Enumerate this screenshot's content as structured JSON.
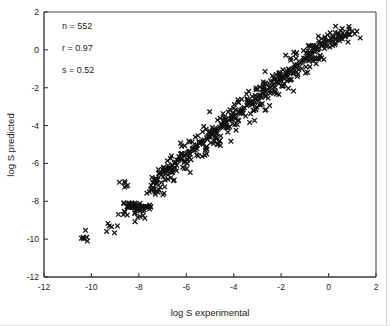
{
  "chart_data": {
    "type": "scatter",
    "title": "",
    "xlabel": "log S experimental",
    "ylabel": "log S predicted",
    "xlim": [
      -12,
      2
    ],
    "ylim": [
      -12,
      2
    ],
    "xticks": [
      -12,
      -10,
      -8,
      -6,
      -4,
      -2,
      0,
      2
    ],
    "yticks": [
      -12,
      -10,
      -8,
      -6,
      -4,
      -2,
      0,
      2
    ],
    "xtick_labels": [
      "-12",
      "-10",
      "-8",
      "-6",
      "-4",
      "-2",
      "0",
      "2"
    ],
    "ytick_labels": [
      "-12",
      "-10",
      "-8",
      "-6",
      "-4",
      "-2",
      "0",
      "2"
    ],
    "grid": false,
    "legend": null,
    "marker": "x",
    "marker_color": "#111111",
    "annotations": [
      "n = 552",
      "r = 0.97",
      "s = 0.52"
    ],
    "statistics": {
      "n_label": "n = 552",
      "r_label": "r = 0.97",
      "s_label": "s = 0.52",
      "n": 552,
      "r": 0.97,
      "s": 0.52
    },
    "series": [
      {
        "name": "compounds",
        "x": [
          -10.35,
          -10.2,
          -9.25,
          -9.15,
          -8.65,
          -8.6,
          -8.5,
          -8.45,
          -8.4,
          -8.35,
          -8.3,
          -8.28,
          -8.25,
          -8.2,
          -8.15,
          -8.1,
          -8.05,
          -8.0,
          -7.95,
          -7.9,
          -7.85,
          -7.8,
          -7.75,
          -7.7,
          -7.65,
          -7.6,
          -7.55,
          -7.5,
          -7.45,
          -7.4,
          -8.05,
          -7.95,
          -7.1,
          -8.6,
          -7.35,
          -7.3,
          -7.25,
          -7.2,
          -7.15,
          -7.05,
          -7.0,
          -6.95,
          -6.9,
          -6.85,
          -6.8,
          -6.75,
          -6.7,
          -6.65,
          -6.6,
          -6.55,
          -6.5,
          -6.45,
          -6.4,
          -6.35,
          -6.3,
          -6.25,
          -6.2,
          -6.15,
          -6.1,
          -6.05,
          -6.0,
          -5.95,
          -5.9,
          -5.85,
          -5.8,
          -5.75,
          -5.7,
          -5.65,
          -5.6,
          -5.55,
          -5.5,
          -5.45,
          -5.4,
          -5.35,
          -5.3,
          -5.25,
          -5.2,
          -5.15,
          -5.1,
          -5.05,
          -5.0,
          -4.95,
          -4.9,
          -4.85,
          -4.8,
          -4.75,
          -4.7,
          -4.65,
          -4.6,
          -4.55,
          -4.5,
          -4.45,
          -4.4,
          -4.35,
          -4.3,
          -4.25,
          -4.2,
          -4.15,
          -4.1,
          -4.05,
          -4.0,
          -3.95,
          -3.9,
          -3.85,
          -3.8,
          -3.75,
          -3.7,
          -3.65,
          -3.6,
          -3.55,
          -3.5,
          -3.45,
          -3.4,
          -3.35,
          -3.3,
          -3.25,
          -3.2,
          -3.15,
          -3.1,
          -3.05,
          -3.0,
          -2.95,
          -2.9,
          -2.85,
          -2.8,
          -2.75,
          -2.7,
          -2.65,
          -2.6,
          -2.55,
          -2.5,
          -2.45,
          -2.4,
          -2.35,
          -2.3,
          -2.25,
          -2.2,
          -2.15,
          -2.1,
          -2.05,
          -2.0,
          -1.95,
          -1.9,
          -1.85,
          -1.8,
          -1.75,
          -1.7,
          -1.65,
          -1.6,
          -1.55,
          -1.5,
          -1.45,
          -1.4,
          -1.35,
          -1.3,
          -1.25,
          -1.2,
          -1.15,
          -1.1,
          -1.05,
          -1.0,
          -0.95,
          -0.9,
          -0.85,
          -0.8,
          -0.75,
          -0.7,
          -0.65,
          -0.6,
          -0.55,
          -0.5,
          -0.45,
          -0.4,
          -0.35,
          -0.3,
          -0.25,
          -0.2,
          -0.15,
          -0.1,
          -0.05,
          0.0,
          0.05,
          0.1,
          0.15,
          0.2,
          0.3,
          0.4,
          0.5,
          0.6,
          0.7,
          0.8,
          0.9,
          1.0,
          1.1
        ],
        "y": [
          -9.9,
          -9.9,
          -9.3,
          -9.35,
          -8.7,
          -6.95,
          -8.3,
          -8.3,
          -8.3,
          -8.3,
          -8.3,
          -8.3,
          -8.3,
          -8.3,
          -8.3,
          -8.3,
          -8.3,
          -8.3,
          -8.3,
          -8.3,
          -8.3,
          -8.3,
          -8.3,
          -8.3,
          -8.3,
          -8.3,
          -7.5,
          -7.4,
          -7.35,
          -7.3,
          -8.85,
          -8.8,
          -7.25,
          -7.25,
          -6.85,
          -6.8,
          -6.9,
          -6.85,
          -7.4,
          -6.6,
          -6.5,
          -6.45,
          -6.35,
          -6.3,
          -6.4,
          -6.25,
          -6.2,
          -6.75,
          -6.1,
          -6.3,
          -6.0,
          -5.95,
          -6.1,
          -5.85,
          -5.8,
          -5.75,
          -5.7,
          -6.2,
          -5.6,
          -5.55,
          -5.5,
          -5.45,
          -5.4,
          -5.35,
          -5.8,
          -5.25,
          -5.2,
          -5.15,
          -5.1,
          -5.05,
          -5.6,
          -4.95,
          -4.9,
          -4.85,
          -4.8,
          -4.75,
          -5.3,
          -4.65,
          -4.6,
          -4.55,
          -4.5,
          -4.45,
          -4.4,
          -4.95,
          -4.3,
          -4.25,
          -4.2,
          -4.15,
          -4.1,
          -4.55,
          -4.0,
          -3.95,
          -3.9,
          -3.85,
          -3.8,
          -4.35,
          -3.7,
          -3.65,
          -3.6,
          -3.55,
          -3.5,
          -3.45,
          -3.4,
          -3.95,
          -3.3,
          -3.25,
          -3.2,
          -3.15,
          -3.1,
          -3.05,
          -3.5,
          -2.95,
          -2.9,
          -2.85,
          -2.8,
          -2.75,
          -2.7,
          -3.2,
          -2.6,
          -2.55,
          -2.5,
          -2.45,
          -2.4,
          -2.9,
          -2.3,
          -2.25,
          -2.2,
          -2.15,
          -2.1,
          -2.55,
          -2.0,
          -1.95,
          -1.9,
          -1.85,
          -1.8,
          -2.25,
          -1.7,
          -1.65,
          -1.6,
          -1.55,
          -1.5,
          -1.45,
          -1.9,
          -1.35,
          -1.3,
          -1.25,
          -1.2,
          -1.15,
          -1.6,
          -1.05,
          -1.0,
          -0.95,
          -0.9,
          -0.85,
          -1.3,
          -0.75,
          -0.7,
          -0.65,
          -0.6,
          -0.55,
          -0.5,
          -0.9,
          -0.4,
          -0.35,
          -0.3,
          -0.25,
          -0.2,
          -0.6,
          -0.1,
          -0.05,
          0.0,
          0.05,
          0.1,
          -0.3,
          0.2,
          0.25,
          0.3,
          0.35,
          0.4,
          0.45,
          0.5,
          0.15,
          0.6,
          0.4,
          0.7,
          0.55,
          0.8,
          0.6,
          0.9,
          0.75,
          0.95,
          0.8,
          1.0,
          0.85
        ]
      }
    ]
  },
  "figure": {
    "border_color": "#4a4a4a",
    "marker_color": "#111111",
    "background": "#ffffff"
  }
}
